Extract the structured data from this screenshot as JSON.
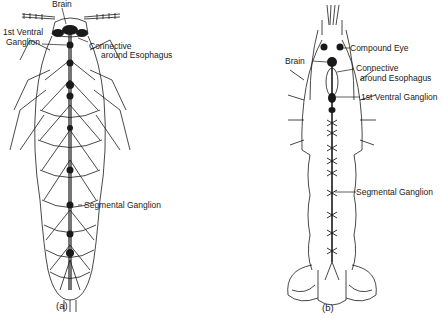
{
  "figure_a": {
    "caption": "(a)",
    "labels": {
      "brain": "Brain",
      "first_ventral_1": "1st Ventral",
      "first_ventral_2": "Ganglion",
      "connective_1": "Connective",
      "connective_2": "around Esophagus",
      "segmental": "Segmental Ganglion"
    }
  },
  "figure_b": {
    "caption": "(b)",
    "labels": {
      "compound_eye": "Compound Eye",
      "brain": "Brain",
      "connective_1": "Connective",
      "connective_2": "around Esophagus",
      "first_ventral": "1st Ventral Ganglion",
      "segmental": "Segmental Ganglion"
    }
  },
  "colors": {
    "ink": "#1a1a1a",
    "background": "#ffffff"
  }
}
